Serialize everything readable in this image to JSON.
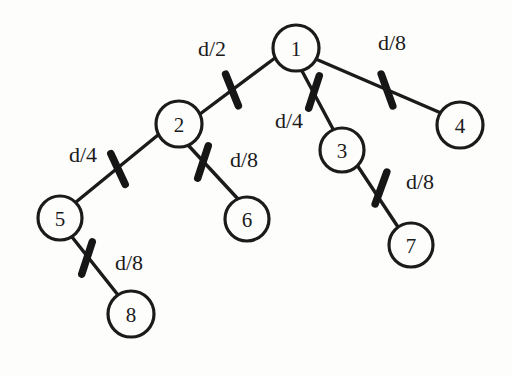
{
  "diagram": {
    "background_color": "#fdfdfc",
    "stroke_color": "#1b1b1b",
    "nodes": [
      {
        "id": "1",
        "label": "1",
        "cx": 296,
        "cy": 48,
        "r": 23
      },
      {
        "id": "2",
        "label": "2",
        "cx": 179,
        "cy": 124,
        "r": 23
      },
      {
        "id": "3",
        "label": "3",
        "cx": 342,
        "cy": 150,
        "r": 22
      },
      {
        "id": "4",
        "label": "4",
        "cx": 460,
        "cy": 125,
        "r": 23
      },
      {
        "id": "5",
        "label": "5",
        "cx": 60,
        "cy": 218,
        "r": 22
      },
      {
        "id": "6",
        "label": "6",
        "cx": 247,
        "cy": 219,
        "r": 22
      },
      {
        "id": "7",
        "label": "7",
        "cx": 411,
        "cy": 245,
        "r": 22
      },
      {
        "id": "8",
        "label": "8",
        "cx": 131,
        "cy": 314,
        "r": 23
      }
    ],
    "edges": [
      {
        "id": "edge-1-2",
        "from": "1",
        "to": "2",
        "x1": 275,
        "y1": 58,
        "x2": 200,
        "y2": 114,
        "weight": "d/2",
        "label_x": 212,
        "label_y": 48,
        "tick_x": 232,
        "tick_y": 90,
        "tick_angle": 68
      },
      {
        "id": "edge-1-3",
        "from": "1",
        "to": "3",
        "x1": 302,
        "y1": 71,
        "x2": 333,
        "y2": 129,
        "weight": "d/4",
        "label_x": 289,
        "label_y": 120,
        "tick_x": 314,
        "tick_y": 92,
        "tick_angle": 108
      },
      {
        "id": "edge-1-4",
        "from": "1",
        "to": "4",
        "x1": 318,
        "y1": 60,
        "x2": 441,
        "y2": 113,
        "weight": "d/8",
        "label_x": 392,
        "label_y": 42,
        "tick_x": 387,
        "tick_y": 90,
        "tick_angle": 70
      },
      {
        "id": "edge-2-5",
        "from": "2",
        "to": "5",
        "x1": 158,
        "y1": 135,
        "x2": 76,
        "y2": 202,
        "weight": "d/4",
        "label_x": 83,
        "label_y": 154,
        "tick_x": 118,
        "tick_y": 169,
        "tick_angle": 65
      },
      {
        "id": "edge-2-6",
        "from": "2",
        "to": "6",
        "x1": 188,
        "y1": 145,
        "x2": 238,
        "y2": 199,
        "weight": "d/8",
        "label_x": 244,
        "label_y": 159,
        "tick_x": 203,
        "tick_y": 162,
        "tick_angle": 108
      },
      {
        "id": "edge-3-7",
        "from": "3",
        "to": "7",
        "x1": 357,
        "y1": 165,
        "x2": 398,
        "y2": 227,
        "weight": "d/8",
        "label_x": 420,
        "label_y": 181,
        "tick_x": 381,
        "tick_y": 188,
        "tick_angle": 110
      },
      {
        "id": "edge-5-8",
        "from": "5",
        "to": "8",
        "x1": 72,
        "y1": 237,
        "x2": 118,
        "y2": 295,
        "weight": "d/8",
        "label_x": 129,
        "label_y": 262,
        "tick_x": 87,
        "tick_y": 258,
        "tick_angle": 108
      }
    ]
  }
}
